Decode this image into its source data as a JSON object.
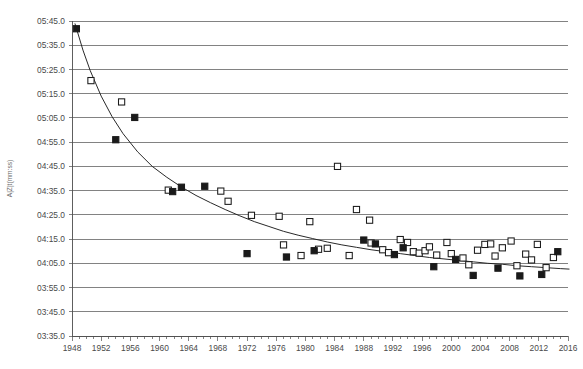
{
  "chart_data": {
    "type": "scatter",
    "title": "",
    "subtitle": "",
    "xlabel": "",
    "ylabel": "A|Z|t(mm:ss)",
    "xlim": [
      1948,
      2016
    ],
    "ylim_labels": [
      "03:35.0",
      "03:45.0",
      "03:55.0",
      "04:05.0",
      "04:15.0",
      "04:25.0",
      "04:35.0",
      "04:45.0",
      "04:55.0",
      "05:05.0",
      "05:15.0",
      "05:25.0",
      "05:35.0",
      "05:45.0"
    ],
    "ylim_seconds": [
      215,
      345
    ],
    "grid": true,
    "legend": "none",
    "xticks": [
      1948,
      1952,
      1956,
      1960,
      1964,
      1968,
      1972,
      1976,
      1980,
      1984,
      1988,
      1992,
      1996,
      2000,
      2004,
      2008,
      2012,
      2016
    ],
    "xminor_tick_interval": 1,
    "yticks": [
      "03:35.0",
      "03:45.0",
      "03:55.0",
      "04:05.0",
      "04:15.0",
      "04:25.0",
      "04:35.0",
      "04:45.0",
      "04:55.0",
      "05:05.0",
      "05:15.0",
      "05:25.0",
      "05:35.0",
      "05:45.0"
    ],
    "series": [
      {
        "name": "filled-squares",
        "marker": "filled-square",
        "color": "#1a1a1a",
        "points": [
          {
            "x": 1948.6,
            "y": 341.8
          },
          {
            "x": 1954.0,
            "y": 296.0
          },
          {
            "x": 1956.6,
            "y": 305.2
          },
          {
            "x": 1961.8,
            "y": 274.6
          },
          {
            "x": 1963.0,
            "y": 276.4
          },
          {
            "x": 1966.2,
            "y": 276.8
          },
          {
            "x": 1972.0,
            "y": 249.0
          },
          {
            "x": 1977.4,
            "y": 247.6
          },
          {
            "x": 1981.2,
            "y": 250.2
          },
          {
            "x": 1988.0,
            "y": 254.6
          },
          {
            "x": 1989.6,
            "y": 253.0
          },
          {
            "x": 1992.2,
            "y": 248.6
          },
          {
            "x": 1993.4,
            "y": 251.4
          },
          {
            "x": 1997.6,
            "y": 243.6
          },
          {
            "x": 2000.6,
            "y": 246.6
          },
          {
            "x": 2003.0,
            "y": 240.0
          },
          {
            "x": 2006.4,
            "y": 243.0
          },
          {
            "x": 2009.4,
            "y": 239.8
          },
          {
            "x": 2012.4,
            "y": 240.4
          },
          {
            "x": 2014.6,
            "y": 249.8
          }
        ]
      },
      {
        "name": "open-squares",
        "marker": "open-square",
        "color": "#ffffff",
        "points": [
          {
            "x": 1950.6,
            "y": 320.4
          },
          {
            "x": 1954.8,
            "y": 311.6
          },
          {
            "x": 1961.2,
            "y": 275.2
          },
          {
            "x": 1968.4,
            "y": 274.8
          },
          {
            "x": 1969.4,
            "y": 270.6
          },
          {
            "x": 1972.6,
            "y": 264.8
          },
          {
            "x": 1976.4,
            "y": 264.4
          },
          {
            "x": 1977.0,
            "y": 252.6
          },
          {
            "x": 1979.4,
            "y": 248.2
          },
          {
            "x": 1980.6,
            "y": 262.2
          },
          {
            "x": 1981.8,
            "y": 250.8
          },
          {
            "x": 1983.0,
            "y": 251.2
          },
          {
            "x": 1984.4,
            "y": 285.0
          },
          {
            "x": 1986.0,
            "y": 248.2
          },
          {
            "x": 1987.0,
            "y": 267.2
          },
          {
            "x": 1988.8,
            "y": 262.8
          },
          {
            "x": 1989.0,
            "y": 253.4
          },
          {
            "x": 1990.6,
            "y": 250.6
          },
          {
            "x": 1991.4,
            "y": 249.4
          },
          {
            "x": 1993.0,
            "y": 254.8
          },
          {
            "x": 1994.0,
            "y": 253.6
          },
          {
            "x": 1994.8,
            "y": 249.8
          },
          {
            "x": 1995.6,
            "y": 249.2
          },
          {
            "x": 1996.4,
            "y": 250.2
          },
          {
            "x": 1997.0,
            "y": 251.8
          },
          {
            "x": 1998.0,
            "y": 248.4
          },
          {
            "x": 1999.4,
            "y": 253.6
          },
          {
            "x": 2000.0,
            "y": 249.0
          },
          {
            "x": 2001.6,
            "y": 247.2
          },
          {
            "x": 2002.4,
            "y": 244.4
          },
          {
            "x": 2003.6,
            "y": 250.4
          },
          {
            "x": 2004.6,
            "y": 252.8
          },
          {
            "x": 2005.4,
            "y": 253.0
          },
          {
            "x": 2006.0,
            "y": 248.0
          },
          {
            "x": 2007.0,
            "y": 251.4
          },
          {
            "x": 2008.2,
            "y": 254.2
          },
          {
            "x": 2009.0,
            "y": 244.0
          },
          {
            "x": 2010.2,
            "y": 248.8
          },
          {
            "x": 2011.0,
            "y": 246.4
          },
          {
            "x": 2011.8,
            "y": 252.8
          },
          {
            "x": 2013.0,
            "y": 243.2
          },
          {
            "x": 2014.0,
            "y": 247.4
          }
        ]
      }
    ],
    "trendline": {
      "name": "fitted-decay-curve",
      "color": "#1d1d1d",
      "points": [
        {
          "x": 1948.4,
          "y": 344.0
        },
        {
          "x": 1949.5,
          "y": 333.0
        },
        {
          "x": 1950.5,
          "y": 324.5
        },
        {
          "x": 1952.0,
          "y": 314.0
        },
        {
          "x": 1953.5,
          "y": 305.5
        },
        {
          "x": 1955.0,
          "y": 298.5
        },
        {
          "x": 1957.0,
          "y": 291.0
        },
        {
          "x": 1959.0,
          "y": 285.0
        },
        {
          "x": 1961.0,
          "y": 280.5
        },
        {
          "x": 1963.0,
          "y": 276.5
        },
        {
          "x": 1965.0,
          "y": 273.0
        },
        {
          "x": 1967.0,
          "y": 270.0
        },
        {
          "x": 1969.0,
          "y": 267.2
        },
        {
          "x": 1971.0,
          "y": 264.6
        },
        {
          "x": 1973.0,
          "y": 262.2
        },
        {
          "x": 1975.0,
          "y": 260.2
        },
        {
          "x": 1977.0,
          "y": 258.2
        },
        {
          "x": 1979.0,
          "y": 256.6
        },
        {
          "x": 1981.0,
          "y": 255.2
        },
        {
          "x": 1983.0,
          "y": 253.8
        },
        {
          "x": 1985.0,
          "y": 252.6
        },
        {
          "x": 1987.0,
          "y": 251.6
        },
        {
          "x": 1989.0,
          "y": 250.6
        },
        {
          "x": 1991.0,
          "y": 249.8
        },
        {
          "x": 1993.0,
          "y": 249.0
        },
        {
          "x": 1995.0,
          "y": 248.2
        },
        {
          "x": 1997.0,
          "y": 247.4
        },
        {
          "x": 1999.0,
          "y": 246.8
        },
        {
          "x": 2001.0,
          "y": 246.2
        },
        {
          "x": 2003.0,
          "y": 245.6
        },
        {
          "x": 2005.0,
          "y": 245.0
        },
        {
          "x": 2007.0,
          "y": 244.6
        },
        {
          "x": 2009.0,
          "y": 244.0
        },
        {
          "x": 2011.0,
          "y": 243.6
        },
        {
          "x": 2013.0,
          "y": 243.2
        },
        {
          "x": 2015.0,
          "y": 242.8
        },
        {
          "x": 2016.2,
          "y": 242.6
        }
      ]
    }
  },
  "axes": {
    "y_title": "A|Z|t(mm:ss)",
    "y_tick_labels": [
      "05:45.0",
      "05:35.0",
      "05:25.0",
      "05:15.0",
      "05:05.0",
      "04:55.0",
      "04:45.0",
      "04:35.0",
      "04:25.0",
      "04:15.0",
      "04:05.0",
      "03:55.0",
      "03:45.0",
      "03:35.0"
    ],
    "x_tick_labels": [
      "1948",
      "1952",
      "1956",
      "1960",
      "1964",
      "1968",
      "1972",
      "1976",
      "1980",
      "1984",
      "1988",
      "1992",
      "1996",
      "2000",
      "2004",
      "2008",
      "2012",
      "2016"
    ]
  },
  "style": {
    "grid_color": "#4d4d4d",
    "marker_color": "#1a1a1a",
    "trend_color": "#1d1d1d",
    "background": "#ffffff"
  }
}
